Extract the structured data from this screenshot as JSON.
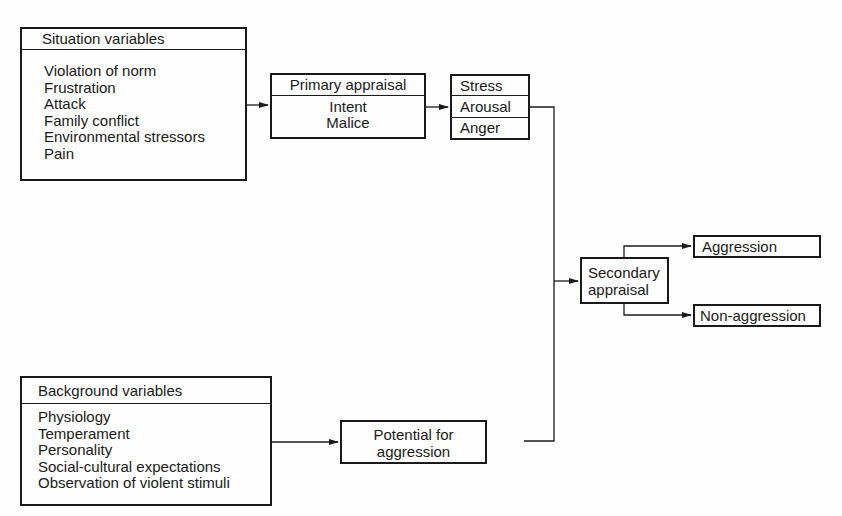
{
  "diagram": {
    "situation": {
      "title": "Situation variables",
      "items": [
        "Violation of norm",
        "Frustration",
        "Attack",
        "Family conflict",
        "Environmental stressors",
        "Pain"
      ]
    },
    "primary": {
      "title": "Primary appraisal",
      "items": [
        "Intent",
        "Malice"
      ]
    },
    "states": {
      "items": [
        "Stress",
        "Arousal",
        "Anger"
      ]
    },
    "secondary": {
      "line1": "Secondary",
      "line2": "appraisal"
    },
    "outcomes": {
      "aggression": "Aggression",
      "non_aggression": "Non-aggression"
    },
    "background": {
      "title": "Background variables",
      "items": [
        "Physiology",
        "Temperament",
        "Personality",
        "Social-cultural expectations",
        "Observation of violent stimuli"
      ]
    },
    "potential": {
      "line1": "Potential for",
      "line2": "aggression"
    }
  }
}
